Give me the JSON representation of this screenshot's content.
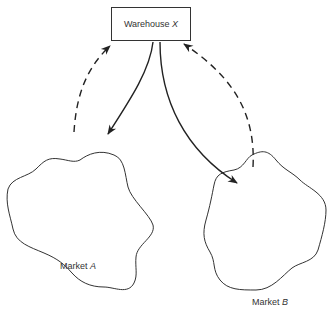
{
  "diagram": {
    "warehouse": {
      "name": "Warehouse",
      "id": "X"
    },
    "markets": [
      {
        "name": "Market",
        "id": "A"
      },
      {
        "name": "Market",
        "id": "B"
      }
    ],
    "flows": [
      {
        "from": "Warehouse X",
        "to": "Market A",
        "style": "solid"
      },
      {
        "from": "Market A",
        "to": "Warehouse X",
        "style": "dashed"
      },
      {
        "from": "Warehouse X",
        "to": "Market B",
        "style": "solid"
      },
      {
        "from": "Market B",
        "to": "Warehouse X",
        "style": "dashed"
      }
    ],
    "stroke_color": "#333333"
  }
}
